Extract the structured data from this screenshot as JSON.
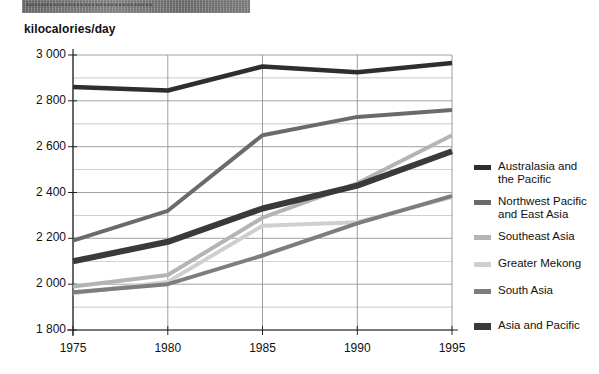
{
  "banner": {
    "text": "▪▪▪▪▪▪▪▪▪▪▪▪▪▪▪▪▪▪▪▪▪▪▪▪▪▪▪▪▪▪▪▪▪",
    "color": "#6e6e6e"
  },
  "axis_title": "kilocalories/day",
  "legend": {
    "items": [
      {
        "label": "Australasia and\nthe Pacific",
        "color": "#2e2e2e",
        "thick": false
      },
      {
        "label": "Northwest Pacific\nand East Asia",
        "color": "#6a6a6a",
        "thick": false
      },
      {
        "label": "Southeast Asia",
        "color": "#b4b4b4",
        "thick": false
      },
      {
        "label": "Greater Mekong",
        "color": "#cfcfcf",
        "thick": false
      },
      {
        "label": "South Asia",
        "color": "#7d7d7d",
        "thick": false
      },
      {
        "label": "Asia and Pacific",
        "color": "#3a3a3a",
        "thick": true
      }
    ]
  },
  "chart_data": {
    "type": "line",
    "title": "",
    "xlabel": "",
    "ylabel": "kilocalories/day",
    "x": [
      1975,
      1980,
      1985,
      1990,
      1995
    ],
    "xtick_labels": [
      "1975",
      "1980",
      "1985",
      "1990",
      "1995"
    ],
    "ytick_labels": [
      "1 800",
      "2 000",
      "2 200",
      "2 400",
      "2 600",
      "2 800",
      "3 000"
    ],
    "yticks": [
      1800,
      2000,
      2200,
      2400,
      2600,
      2800,
      3000
    ],
    "ylim": [
      1800,
      3000
    ],
    "xlim": [
      1975,
      1995
    ],
    "grid": true,
    "minor_grid_step": 100,
    "legend_position": "right",
    "series": [
      {
        "name": "Australasia and the Pacific",
        "color": "#2e2e2e",
        "width": 4.5,
        "values": [
          2860,
          2845,
          2950,
          2925,
          2965
        ]
      },
      {
        "name": "Northwest Pacific and East Asia",
        "color": "#6a6a6a",
        "width": 4,
        "values": [
          2190,
          2320,
          2650,
          2730,
          2760
        ]
      },
      {
        "name": "Southeast Asia",
        "color": "#b4b4b4",
        "width": 4,
        "values": [
          1990,
          2040,
          2290,
          2440,
          2650
        ]
      },
      {
        "name": "Greater Mekong",
        "color": "#cfcfcf",
        "width": 4,
        "values": [
          1960,
          2010,
          2255,
          2270,
          2380
        ]
      },
      {
        "name": "South Asia",
        "color": "#7d7d7d",
        "width": 4,
        "values": [
          1965,
          2000,
          2125,
          2265,
          2385
        ]
      },
      {
        "name": "Asia and Pacific",
        "color": "#3a3a3a",
        "width": 6,
        "values": [
          2100,
          2185,
          2330,
          2430,
          2580
        ]
      }
    ]
  }
}
